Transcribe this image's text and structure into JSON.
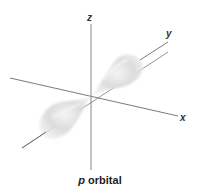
{
  "diagram": {
    "caption_symbol": "p",
    "caption_text": " orbital",
    "axes": {
      "x_label": "x",
      "y_label": "y",
      "z_label": "z"
    },
    "colors": {
      "axis": "#6b6b6b",
      "lobe": "#d9d9d9",
      "label": "#333333"
    }
  }
}
